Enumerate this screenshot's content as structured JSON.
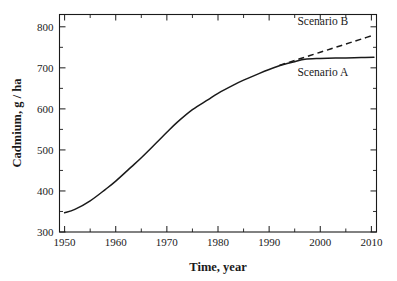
{
  "chart_data": {
    "type": "line",
    "title": "",
    "xlabel": "Time, year",
    "ylabel": "Cadmium, g / ha",
    "xlim": [
      1949,
      2011
    ],
    "ylim": [
      300,
      830
    ],
    "grid": false,
    "legend_position": "inline-annotations",
    "xticks": [
      1950,
      1960,
      1970,
      1980,
      1990,
      2000,
      2010
    ],
    "xticklabels": [
      "1950",
      "1960",
      "1970",
      "1980",
      "1990",
      "2000",
      "2010"
    ],
    "xminor_step": 5,
    "yticks": [
      300,
      400,
      500,
      600,
      700,
      800
    ],
    "yticklabels": [
      "300",
      "400",
      "500",
      "600",
      "700",
      "800"
    ],
    "yminor_step": 50,
    "series": [
      {
        "name": "Scenario A",
        "style": "solid",
        "color": "#1a1a1a",
        "x": [
          1950,
          1952,
          1955,
          1958,
          1960,
          1963,
          1965,
          1968,
          1970,
          1972,
          1975,
          1978,
          1980,
          1983,
          1985,
          1988,
          1990,
          1992,
          1993,
          1995,
          1997,
          2000,
          2003,
          2005,
          2008,
          2010.5
        ],
        "y": [
          347,
          355,
          376,
          404,
          424,
          458,
          481,
          518,
          543,
          567,
          598,
          622,
          638,
          658,
          670,
          686,
          696,
          705,
          709,
          715,
          721,
          723,
          724,
          724,
          725,
          726
        ]
      },
      {
        "name": "Scenario B",
        "style": "dashed",
        "color": "#1a1a1a",
        "x": [
          1992,
          1994,
          1996,
          1998,
          2000,
          2002,
          2004,
          2006,
          2008,
          2010.5
        ],
        "y": [
          706,
          714,
          722,
          730,
          738,
          746,
          754,
          762,
          770,
          780
        ]
      }
    ],
    "annotations": [
      {
        "text": "Scenario B",
        "x": 2000.5,
        "y": 805
      },
      {
        "text": "Scenario A",
        "x": 2000.5,
        "y": 680
      }
    ]
  },
  "axes": {
    "x_title": "Time, year",
    "y_title": "Cadmium, g / ha"
  },
  "labels": {
    "scenario_b": "Scenario B",
    "scenario_a": "Scenario A"
  },
  "colors": {
    "line": "#1a1a1a",
    "frame": "#1a1a1a",
    "background": "#ffffff"
  }
}
